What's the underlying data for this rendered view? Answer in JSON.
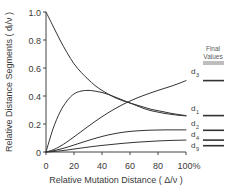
{
  "chart_data": {
    "type": "line",
    "title": "",
    "xlabel": "Relative Mutation Distance ( Δ/ν )",
    "ylabel": "Relative Distance Segments  ( dᵢ/ν )",
    "xlim": [
      0,
      100
    ],
    "ylim": [
      0,
      1.0
    ],
    "xticks": [
      0,
      20,
      40,
      60,
      80,
      100
    ],
    "xticklabels": [
      "0",
      "20",
      "40",
      "60",
      "80",
      "100%"
    ],
    "yticks": [
      0,
      0.2,
      0.4,
      0.6,
      0.8,
      1.0
    ],
    "yticklabels": [
      "0",
      "0.2",
      "0.4",
      "0.6",
      "0.8",
      "1.0"
    ],
    "grid": false,
    "legend_position": "right-inline",
    "annotation": {
      "line1": "Final",
      "line2": "Values"
    },
    "x": [
      0,
      5,
      10,
      15,
      20,
      25,
      30,
      35,
      40,
      45,
      50,
      55,
      60,
      65,
      70,
      75,
      80,
      85,
      90,
      95,
      100
    ],
    "series": [
      {
        "name": "d1",
        "label": "d",
        "subscript": "1",
        "final_value": 0.26,
        "values": [
          1.0,
          0.9,
          0.8,
          0.71,
          0.63,
          0.57,
          0.52,
          0.475,
          0.44,
          0.41,
          0.385,
          0.365,
          0.35,
          0.335,
          0.32,
          0.305,
          0.295,
          0.285,
          0.275,
          0.267,
          0.26
        ]
      },
      {
        "name": "d2",
        "label": "d",
        "subscript": "2",
        "final_value": 0.155,
        "values": [
          0.0,
          0.165,
          0.285,
          0.365,
          0.415,
          0.435,
          0.44,
          0.435,
          0.425,
          0.41,
          0.39,
          0.37,
          0.35,
          0.33,
          0.31,
          0.295,
          0.285,
          0.275,
          0.268,
          0.262,
          0.258
        ]
      },
      {
        "name": "d3",
        "label": "d",
        "subscript": "3",
        "final_value": 0.51,
        "values": [
          0.0,
          0.015,
          0.04,
          0.072,
          0.108,
          0.145,
          0.182,
          0.218,
          0.252,
          0.284,
          0.313,
          0.34,
          0.364,
          0.386,
          0.405,
          0.423,
          0.44,
          0.456,
          0.472,
          0.49,
          0.51
        ]
      },
      {
        "name": "d4",
        "label": "d",
        "subscript": "4",
        "final_value": 0.085,
        "values": [
          0.0,
          0.008,
          0.02,
          0.034,
          0.05,
          0.066,
          0.082,
          0.097,
          0.111,
          0.123,
          0.133,
          0.141,
          0.147,
          0.151,
          0.154,
          0.156,
          0.157,
          0.158,
          0.158,
          0.158,
          0.158
        ]
      },
      {
        "name": "d9",
        "label": "d",
        "subscript": "9",
        "final_value": 0.045,
        "values": [
          0.0,
          0.003,
          0.008,
          0.014,
          0.021,
          0.028,
          0.035,
          0.041,
          0.047,
          0.052,
          0.057,
          0.062,
          0.066,
          0.07,
          0.073,
          0.076,
          0.079,
          0.081,
          0.083,
          0.084,
          0.085
        ]
      }
    ],
    "final_value_marks": [
      0.51,
      0.26,
      0.155,
      0.085,
      0.045
    ]
  }
}
